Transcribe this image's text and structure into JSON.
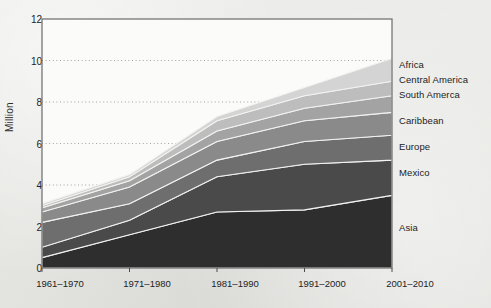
{
  "chart_data": {
    "type": "area",
    "stacked": true,
    "title": "",
    "xlabel": "",
    "ylabel": "Million",
    "categories": [
      "1961–1970",
      "1971–1980",
      "1981–1990",
      "1991–2000",
      "2001–2010"
    ],
    "ylim": [
      0,
      12
    ],
    "yticks": [
      0,
      2,
      4,
      6,
      8,
      10,
      12
    ],
    "ytick_labels": [
      "0",
      "2",
      "4",
      "6",
      "8",
      "10",
      "12"
    ],
    "grid": true,
    "grid_style": "dotted-horizontal",
    "legend_position": "right-inline",
    "series": [
      {
        "name": "Asia",
        "color": "#2e2e2e",
        "values": [
          0.5,
          1.6,
          2.7,
          2.8,
          3.5
        ]
      },
      {
        "name": "Mexico",
        "color": "#4a4a4a",
        "values": [
          0.5,
          0.7,
          1.7,
          2.2,
          1.7
        ]
      },
      {
        "name": "Europe",
        "color": "#6e6e6e",
        "values": [
          1.2,
          0.8,
          0.8,
          1.1,
          1.2
        ]
      },
      {
        "name": "Caribbean",
        "color": "#8a8a8a",
        "values": [
          0.5,
          0.8,
          0.9,
          1.0,
          1.1
        ]
      },
      {
        "name": "South Amerca",
        "color": "#a3a3a3",
        "values": [
          0.2,
          0.3,
          0.5,
          0.6,
          0.8
        ]
      },
      {
        "name": "Central America",
        "color": "#bdbdbd",
        "values": [
          0.1,
          0.2,
          0.5,
          0.6,
          0.7
        ]
      },
      {
        "name": "Africa",
        "color": "#d4d4d4",
        "values": [
          0.1,
          0.1,
          0.2,
          0.4,
          1.1
        ]
      }
    ],
    "totals": [
      3.1,
      4.5,
      7.3,
      8.7,
      10.1
    ]
  },
  "legend": {
    "items": [
      {
        "label": "Africa"
      },
      {
        "label": "Central America"
      },
      {
        "label": "South Amerca"
      },
      {
        "label": "Caribbean"
      },
      {
        "label": "Europe"
      },
      {
        "label": "Mexico"
      },
      {
        "label": "Asia"
      }
    ]
  }
}
